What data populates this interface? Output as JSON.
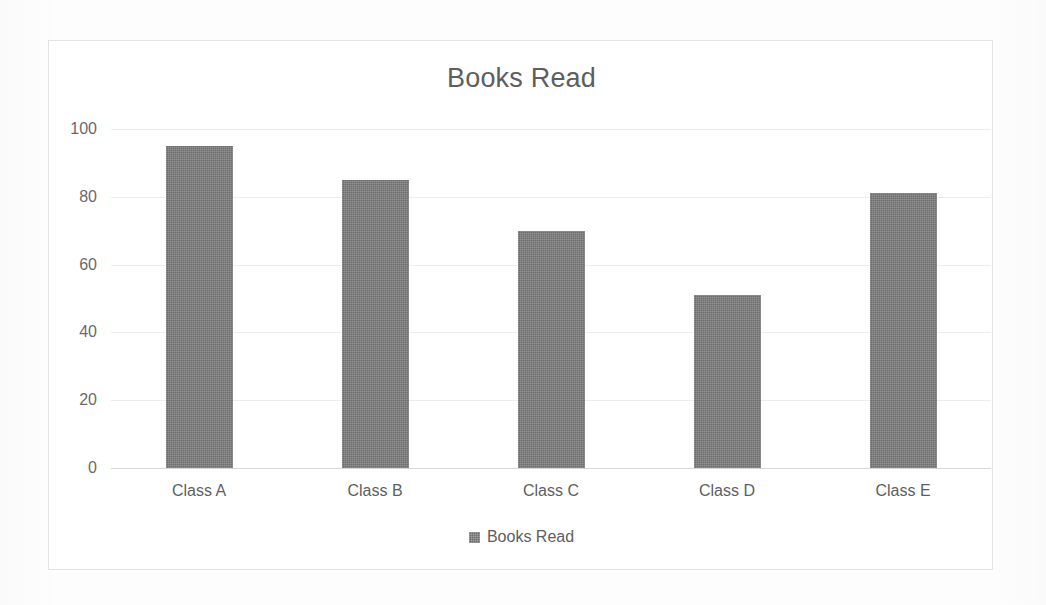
{
  "chart_data": {
    "type": "bar",
    "title": "Books Read",
    "xlabel": "",
    "ylabel": "",
    "categories": [
      "Class A",
      "Class B",
      "Class C",
      "Class D",
      "Class E"
    ],
    "values": [
      95,
      85,
      70,
      51,
      81
    ],
    "series": [
      {
        "name": "Books Read",
        "values": [
          95,
          85,
          70,
          51,
          81
        ]
      }
    ],
    "ylim": [
      0,
      100
    ],
    "yticks": [
      0,
      20,
      40,
      60,
      80,
      100
    ],
    "ytick_labels": [
      "0",
      "20",
      "40",
      "60",
      "80",
      "100"
    ],
    "grid": true,
    "legend": {
      "position": "bottom",
      "entries": [
        "Books Read"
      ]
    }
  },
  "style": {
    "bar_color": "#6d6d6d",
    "text_color": "#5e5e5e",
    "tick_color": "#6a6a6a",
    "gridline_color": "#ededed",
    "axis_color": "#d8d8d8",
    "frame_border_color": "#e4e4e4",
    "background": "#fdfdfd"
  }
}
